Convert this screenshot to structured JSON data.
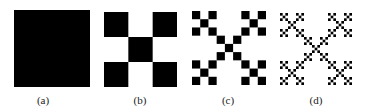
{
  "figure": {
    "fill_color": "#000000",
    "background": "#ffffff",
    "panels": [
      {
        "label": "(a)",
        "iteration": 0
      },
      {
        "label": "(b)",
        "iteration": 1
      },
      {
        "label": "(c)",
        "iteration": 2
      },
      {
        "label": "(d)",
        "iteration": 3
      }
    ]
  }
}
